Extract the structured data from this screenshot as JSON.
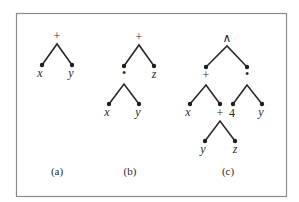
{
  "figure": {
    "trees": [
      {
        "id": "a",
        "caption": "(a)",
        "root_label": "+",
        "left_leaf": "x",
        "right_leaf": "y"
      },
      {
        "id": "b",
        "caption": "(b)",
        "root_label": "+",
        "left_child_label": "•",
        "right_leaf": "z",
        "sub_left_leaf": "x",
        "sub_right_leaf": "y"
      },
      {
        "id": "c",
        "caption": "(c)",
        "root_label": "∧",
        "left_child_label": "+",
        "right_child_label": "•",
        "left_sub_left_leaf": "x",
        "left_sub_right_label": "+",
        "right_sub_left_leaf": "4",
        "right_sub_right_leaf": "y",
        "bottom_left_leaf": "y",
        "bottom_right_leaf": "z"
      }
    ]
  }
}
